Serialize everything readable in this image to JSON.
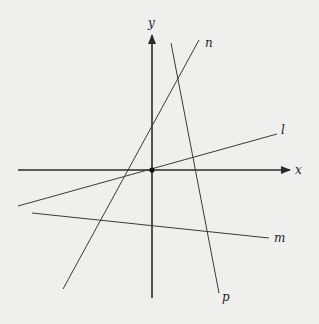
{
  "diagram": {
    "type": "coordinate-plane-with-lines",
    "background": "#efefed",
    "line_color": "#3a3a3a",
    "axis_color": "#2a2a2a",
    "origin": {
      "x": 152,
      "y": 170
    },
    "axes": {
      "x": {
        "label": "x",
        "x1": 18,
        "x2": 290,
        "y": 170,
        "label_x": 295,
        "label_y": 174
      },
      "y": {
        "label": "y",
        "y1": 298,
        "y2": 35,
        "x": 152,
        "label_x": 148,
        "label_y": 27
      }
    },
    "lines": [
      {
        "name": "n",
        "label": "n",
        "x1": 63,
        "y1": 289,
        "x2": 199,
        "y2": 40,
        "label_x": 205,
        "label_y": 47
      },
      {
        "name": "p",
        "label": "p",
        "x1": 171,
        "y1": 43,
        "x2": 219,
        "y2": 293,
        "label_x": 222,
        "label_y": 301
      },
      {
        "name": "l",
        "label": "l",
        "x1": 18,
        "y1": 206,
        "x2": 277,
        "y2": 134,
        "label_x": 281,
        "label_y": 134
      },
      {
        "name": "m",
        "label": "m",
        "x1": 32,
        "y1": 213,
        "x2": 269,
        "y2": 238,
        "label_x": 274,
        "label_y": 242
      }
    ]
  }
}
